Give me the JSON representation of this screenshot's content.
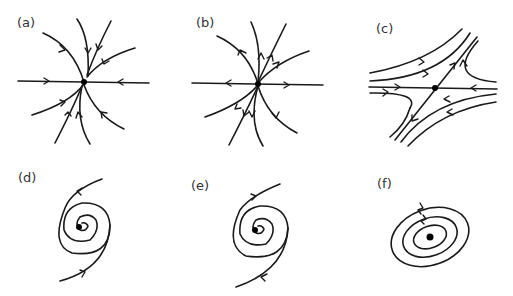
{
  "figure": {
    "panels": [
      {
        "id": "a",
        "label": "(a)",
        "type": "stable-node"
      },
      {
        "id": "b",
        "label": "(b)",
        "type": "unstable-node"
      },
      {
        "id": "c",
        "label": "(c)",
        "type": "saddle-point"
      },
      {
        "id": "d",
        "label": "(d)",
        "type": "stable-spiral"
      },
      {
        "id": "e",
        "label": "(e)",
        "type": "unstable-spiral"
      },
      {
        "id": "f",
        "label": "(f)",
        "type": "center"
      }
    ],
    "colors": {
      "stroke": "#1a1a1a",
      "label": "#333333",
      "background": "#ffffff"
    }
  }
}
